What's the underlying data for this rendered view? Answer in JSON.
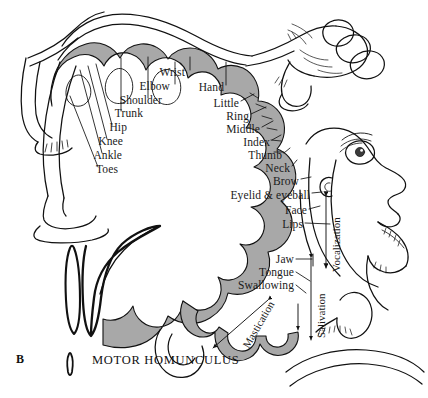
{
  "figure": {
    "panel_letter": "B",
    "caption": "MOTOR HOMUNCULUS",
    "background_color": "#ffffff",
    "cortex_band_color": "#a8a8a8",
    "ink_color": "#111111"
  },
  "labels": {
    "left_column": [
      {
        "text": "Wrist",
        "x": 185,
        "y": 73,
        "align": "right"
      },
      {
        "text": "Elbow",
        "x": 170,
        "y": 87,
        "align": "right"
      },
      {
        "text": "Shoulder",
        "x": 160,
        "y": 101,
        "align": "right"
      },
      {
        "text": "Hand",
        "x": 222,
        "y": 88,
        "align": "right"
      },
      {
        "text": "Trunk",
        "x": 143,
        "y": 114,
        "align": "right"
      },
      {
        "text": "Hip",
        "x": 126,
        "y": 128,
        "align": "right"
      },
      {
        "text": "Knee",
        "x": 121,
        "y": 142,
        "align": "right"
      },
      {
        "text": "Ankle",
        "x": 121,
        "y": 156,
        "align": "right"
      },
      {
        "text": "Toes",
        "x": 118,
        "y": 170,
        "align": "right"
      }
    ],
    "right_column": [
      {
        "text": "Little",
        "x": 237,
        "y": 104,
        "align": "right"
      },
      {
        "text": "Ring",
        "x": 247,
        "y": 117,
        "align": "right"
      },
      {
        "text": "Middle",
        "x": 258,
        "y": 130,
        "align": "right"
      },
      {
        "text": "Index",
        "x": 268,
        "y": 143,
        "align": "right"
      },
      {
        "text": "Thumb",
        "x": 280,
        "y": 156,
        "align": "right"
      },
      {
        "text": "Neck",
        "x": 288,
        "y": 169,
        "align": "right"
      },
      {
        "text": "Brow",
        "x": 297,
        "y": 182,
        "align": "right"
      },
      {
        "text": "Eyelid & eyeball",
        "x": 308,
        "y": 196,
        "align": "right"
      },
      {
        "text": "Face",
        "x": 305,
        "y": 212,
        "align": "right"
      },
      {
        "text": "Lips",
        "x": 301,
        "y": 226,
        "align": "right"
      }
    ],
    "lower_column": [
      {
        "text": "Jaw",
        "x": 292,
        "y": 262,
        "align": "right"
      },
      {
        "text": "Tongue",
        "x": 292,
        "y": 275,
        "align": "right"
      },
      {
        "text": "Swallowing",
        "x": 292,
        "y": 288,
        "align": "right"
      }
    ],
    "rotated": [
      {
        "text": "Vocalization",
        "x": 322,
        "y": 268,
        "rotate": -90
      },
      {
        "text": "Salivation",
        "x": 307,
        "y": 330,
        "rotate": -90
      },
      {
        "text": "Mastication",
        "x": 238,
        "y": 337,
        "rotate": -60
      }
    ]
  }
}
